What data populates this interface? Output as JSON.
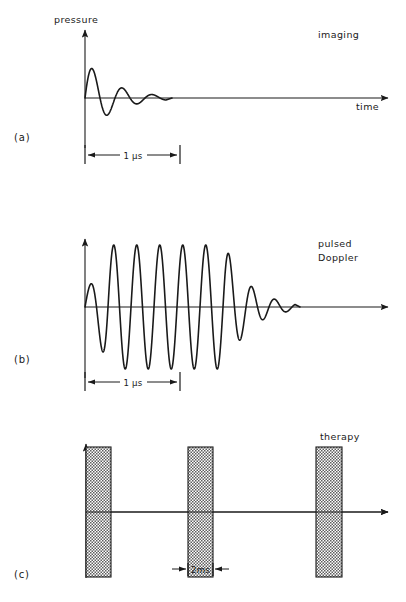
{
  "figure": {
    "width": 406,
    "height": 602,
    "background_color": "#ffffff",
    "ink_color": "#1a1a1a",
    "hatch_fill_color": "#8a8a8a",
    "panels": [
      {
        "id": "panel-a",
        "label": "(a)",
        "label_x": 14,
        "label_y": 141,
        "annotation": "imaging",
        "annotation_lines": [
          "imaging"
        ],
        "annotation_x": 318,
        "annotation_y": 38,
        "y_axis_label": "pressure",
        "y_axis_label_x": 54,
        "y_axis_label_y": 23,
        "x_axis_label": "time",
        "x_axis_label_x": 356,
        "x_axis_label_y": 110,
        "origin_x": 85,
        "baseline_y": 98,
        "y_axis_top": 28,
        "y_axis_bottom": 148,
        "x_axis_end": 392,
        "dimension": {
          "text": "1 µs",
          "text_x": 133,
          "text_y": 159,
          "y": 155,
          "x_start": 85,
          "x_end": 180
        }
      },
      {
        "id": "panel-b",
        "label": "(b)",
        "label_x": 14,
        "label_y": 363,
        "annotation": "pulsed Doppler",
        "annotation_lines": [
          "pulsed",
          "Doppler"
        ],
        "annotation_x": 318,
        "annotation_y": 247,
        "origin_x": 85,
        "baseline_y": 307,
        "y_axis_top": 237,
        "y_axis_bottom": 378,
        "x_axis_end": 392,
        "dimension": {
          "text": "1 µs",
          "text_x": 133,
          "text_y": 386,
          "y": 382,
          "x_start": 85,
          "x_end": 180
        }
      },
      {
        "id": "panel-c",
        "label": "(c)",
        "label_x": 14,
        "label_y": 578,
        "annotation": "therapy",
        "annotation_lines": [
          "therapy"
        ],
        "annotation_x": 320,
        "annotation_y": 440,
        "origin_x": 86,
        "baseline_y": 512,
        "y_axis_top": 442,
        "y_axis_bottom": 578,
        "x_axis_end": 392,
        "dimension": {
          "text": "2ms",
          "text_x": 199,
          "text_y": 573,
          "y": 569,
          "x_start": 175,
          "x_end": 224
        }
      }
    ]
  },
  "chart_data": [
    {
      "type": "line",
      "id": "panel-a-waveform",
      "title": "imaging",
      "xlabel": "time",
      "ylabel": "pressure",
      "description": "Short damped ultrasound pulse, about 2.5 cycles, used for imaging",
      "waveform": "damped-sine-burst",
      "cycles": 2.5,
      "period_px": 30,
      "start_x": 85,
      "peak_amplitude_px": 38,
      "decay_constant_px": 28,
      "end_x": 166,
      "pulse_duration_label": "1 µs",
      "pulse_duration_px": 95,
      "grid": false,
      "legend": "none"
    },
    {
      "type": "line",
      "id": "panel-b-waveform",
      "title": "pulsed Doppler",
      "xlabel": "time",
      "ylabel": "pressure",
      "description": "Longer tone burst, about 9 cycles with rise and decay, used for pulsed Doppler",
      "waveform": "tone-burst",
      "cycles": 9,
      "period_px": 23,
      "start_x": 85,
      "peak_amplitude_px": 62,
      "rise_end_x": 108,
      "plateau_end_x": 225,
      "decay_constant_px": 24,
      "end_x": 295,
      "pulse_duration_label": "1 µs",
      "pulse_duration_px": 95,
      "grid": false,
      "legend": "none"
    },
    {
      "type": "bar",
      "id": "panel-c-waveform",
      "title": "therapy",
      "xlabel": "time",
      "ylabel": "pressure",
      "description": "Long hatched therapy bursts, repeated pulses symmetric about the baseline",
      "waveform": "rectangular-burst-train",
      "burst_count": 3,
      "burst_width_px": 25,
      "burst_half_height_px": 65,
      "burst_label": "2ms",
      "bursts": [
        {
          "x": 86,
          "width": 25
        },
        {
          "x": 188,
          "width": 25
        },
        {
          "x": 316,
          "width": 26
        }
      ],
      "grid": false,
      "legend": "none"
    }
  ]
}
